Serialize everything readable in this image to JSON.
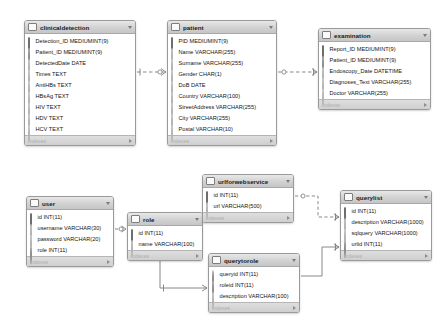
{
  "diagram": {
    "footer_label": "Indexes",
    "line_color": "#7a7a7a",
    "header_color": "#d2d2d2",
    "background": "#ffffff"
  },
  "tables": [
    {
      "name": "clinicaldetection",
      "x": 24,
      "y": 20,
      "width": 112,
      "fields": [
        {
          "label": "Detection_ID MEDIUMINT(9)",
          "key": "pk"
        },
        {
          "label": "Patient_ID MEDIUMINT(9)",
          "key": "fk"
        },
        {
          "label": "DetectedDate DATE",
          "key": "plain"
        },
        {
          "label": "Times TEXT",
          "key": "plain"
        },
        {
          "label": "AntiHBs TEXT",
          "key": "plain"
        },
        {
          "label": "HBsAg TEXT",
          "key": "plain"
        },
        {
          "label": "HIV TEXT",
          "key": "plain"
        },
        {
          "label": "HDV TEXT",
          "key": "plain"
        },
        {
          "label": "HCV TEXT",
          "key": "plain"
        }
      ]
    },
    {
      "name": "patient",
      "x": 167,
      "y": 20,
      "width": 110,
      "fields": [
        {
          "label": "PID MEDIUMINT(9)",
          "key": "pk"
        },
        {
          "label": "Name VARCHAR(255)",
          "key": "plain"
        },
        {
          "label": "Surname VARCHAR(255)",
          "key": "plain"
        },
        {
          "label": "Gender CHAR(1)",
          "key": "plain"
        },
        {
          "label": "DoB DATE",
          "key": "plain"
        },
        {
          "label": "Country VARCHAR(100)",
          "key": "plain"
        },
        {
          "label": "StreetAddress VARCHAR(255)",
          "key": "plain"
        },
        {
          "label": "City VARCHAR(255)",
          "key": "plain"
        },
        {
          "label": "Postal VARCHAR(10)",
          "key": "plain"
        }
      ]
    },
    {
      "name": "examination",
      "x": 318,
      "y": 28,
      "width": 113,
      "fields": [
        {
          "label": "Report_ID MEDIUMINT(9)",
          "key": "pk"
        },
        {
          "label": "Patient_ID MEDIUMINT(9)",
          "key": "fk"
        },
        {
          "label": "Endoscopy_Date DATETIME",
          "key": "plain"
        },
        {
          "label": "Diagnoses_Text VARCHAR(255)",
          "key": "plain"
        },
        {
          "label": "Doctor VARCHAR(255)",
          "key": "plain"
        }
      ]
    },
    {
      "name": "user",
      "x": 26,
      "y": 196,
      "width": 88,
      "fields": [
        {
          "label": "id INT(11)",
          "key": "pk"
        },
        {
          "label": "username VARCHAR(30)",
          "key": "plain"
        },
        {
          "label": "password VARCHAR(20)",
          "key": "plain"
        },
        {
          "label": "role INT(11)",
          "key": "fk"
        }
      ]
    },
    {
      "name": "role",
      "x": 127,
      "y": 212,
      "width": 76,
      "fields": [
        {
          "label": "id INT(11)",
          "key": "pk"
        },
        {
          "label": "name VARCHAR(100)",
          "key": "plain"
        }
      ]
    },
    {
      "name": "urlforwebservice",
      "x": 202,
      "y": 174,
      "width": 92,
      "fields": [
        {
          "label": "id INT(11)",
          "key": "pk"
        },
        {
          "label": "url VARCHAR(500)",
          "key": "plain"
        }
      ]
    },
    {
      "name": "querytorole",
      "x": 208,
      "y": 253,
      "width": 92,
      "fields": [
        {
          "label": "queryid INT(11)",
          "key": "fk"
        },
        {
          "label": "roleid INT(11)",
          "key": "fk"
        },
        {
          "label": "description VARCHAR(100)",
          "key": "plain"
        }
      ]
    },
    {
      "name": "querylist",
      "x": 340,
      "y": 190,
      "width": 92,
      "fields": [
        {
          "label": "id INT(11)",
          "key": "pk"
        },
        {
          "label": "description VARCHAR(1000)",
          "key": "plain"
        },
        {
          "label": "sqlquery VARCHAR(1000)",
          "key": "plain"
        },
        {
          "label": "urlid INT(11)",
          "key": "fk"
        }
      ]
    }
  ],
  "relationships": [
    {
      "from": "clinicaldetection",
      "to": "patient",
      "style": "dashed"
    },
    {
      "from": "patient",
      "to": "examination",
      "style": "dashed"
    },
    {
      "from": "user",
      "to": "role",
      "style": "dashed"
    },
    {
      "from": "role",
      "to": "querytorole",
      "style": "solid"
    },
    {
      "from": "urlforwebservice",
      "to": "querylist",
      "style": "dashed"
    },
    {
      "from": "querytorole",
      "to": "querylist",
      "style": "solid"
    }
  ]
}
